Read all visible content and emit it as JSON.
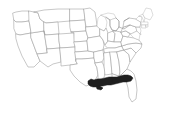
{
  "figure": {
    "kind": "choropleth-locator-map",
    "title": "United States state outline map",
    "width_px": 169,
    "height_px": 116,
    "background_color": "#ffffff",
    "outline_color": "#9a9a9a",
    "highlight_color": "#1f1f1f",
    "caption": ""
  },
  "regions": {
    "highlighted_label": "Gulf Coast",
    "highlighted_states": [
      "Louisiana",
      "Mississippi",
      "Alabama",
      "Florida panhandle"
    ],
    "unhighlighted_label": "Other states"
  },
  "legend": {
    "present": false,
    "items": []
  },
  "labels": {
    "present": false,
    "items": []
  }
}
